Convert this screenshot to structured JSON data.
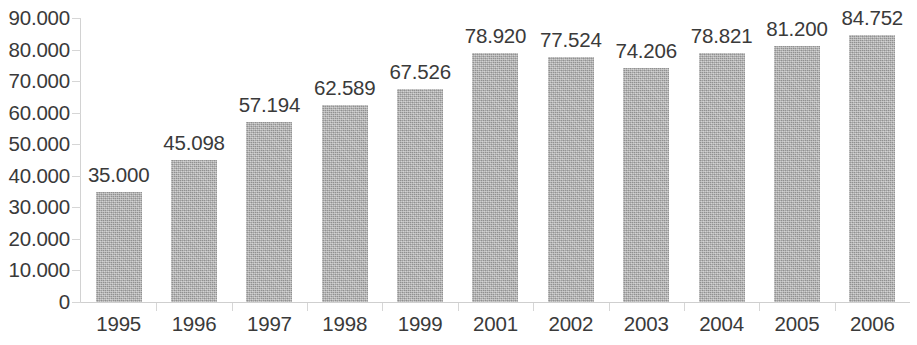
{
  "chart_data": {
    "type": "bar",
    "title": "",
    "subtitle": "",
    "xlabel": "",
    "ylabel": "",
    "categories": [
      "1995",
      "1996",
      "1997",
      "1998",
      "1999",
      "2001",
      "2002",
      "2003",
      "2004",
      "2005",
      "2006"
    ],
    "values": [
      35000,
      45098,
      57194,
      62589,
      67526,
      78920,
      77524,
      74206,
      78821,
      81200,
      84752
    ],
    "data_labels": [
      "35.000",
      "45.098",
      "57.194",
      "62.589",
      "67.526",
      "78.920",
      "77.524",
      "74.206",
      "78.821",
      "81.200",
      "84.752"
    ],
    "ylim": [
      0,
      90000
    ],
    "y_tick_values": [
      90000,
      80000,
      70000,
      60000,
      50000,
      40000,
      30000,
      20000,
      10000,
      0
    ],
    "y_tick_labels": [
      "90.000",
      "80.000",
      "70.000",
      "60.000",
      "50.000",
      "40.000",
      "30.000",
      "20.000",
      "10.000",
      "0"
    ],
    "grid": false,
    "legend": null,
    "legend_position": "none",
    "series": [
      {
        "name": "",
        "values": [
          35000,
          45098,
          57194,
          62589,
          67526,
          78920,
          77524,
          74206,
          78821,
          81200,
          84752
        ]
      }
    ],
    "bar_color": "#a8a8a8",
    "text_color": "#3a3a3a",
    "axis_color": "#d2d2d2",
    "background_color": "#ffffff"
  }
}
